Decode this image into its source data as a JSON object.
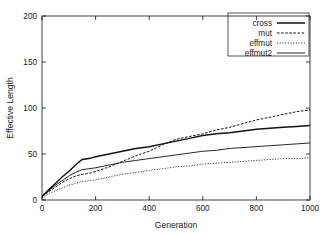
{
  "chart_data": {
    "type": "line",
    "title": "",
    "xlabel": "Generation",
    "ylabel": "Effective Length",
    "xlim": [
      0,
      1000
    ],
    "ylim": [
      0,
      200
    ],
    "xticks": [
      0,
      200,
      400,
      600,
      800,
      1000
    ],
    "yticks": [
      0,
      50,
      100,
      150,
      200
    ],
    "xtick_labels": [
      "0",
      "200",
      "400",
      "600",
      "800",
      "1000"
    ],
    "ytick_labels": [
      "0",
      "50",
      "100",
      "150",
      "200"
    ],
    "grid": false,
    "legend_position": "top-right-inside",
    "x": [
      0,
      25,
      50,
      75,
      100,
      125,
      150,
      175,
      200,
      250,
      300,
      350,
      400,
      450,
      500,
      550,
      600,
      650,
      700,
      750,
      800,
      850,
      900,
      950,
      1000
    ],
    "series": [
      {
        "name": "cross",
        "style": "solid-thick",
        "values": [
          4,
          11,
          18,
          25,
          31,
          38,
          44,
          45,
          47,
          50,
          53,
          56,
          58,
          61,
          64,
          67,
          70,
          72,
          73,
          75,
          77,
          78,
          79,
          80,
          81
        ]
      },
      {
        "name": "mut",
        "style": "dashed",
        "values": [
          4,
          9,
          14,
          19,
          23,
          26,
          28,
          29,
          31,
          36,
          42,
          48,
          53,
          60,
          66,
          69,
          72,
          76,
          79,
          83,
          87,
          90,
          93,
          96,
          98
        ]
      },
      {
        "name": "effmut",
        "style": "fine-dotted",
        "values": [
          3,
          7,
          10,
          13,
          16,
          18,
          20,
          21,
          22,
          25,
          28,
          30,
          32,
          34,
          36,
          37,
          39,
          40,
          41,
          42,
          43,
          44,
          45,
          45,
          46
        ]
      },
      {
        "name": "effmut2",
        "style": "solid-thin",
        "values": [
          4,
          10,
          16,
          21,
          26,
          30,
          33,
          34,
          35,
          38,
          41,
          43,
          45,
          47,
          49,
          51,
          53,
          54,
          56,
          57,
          58,
          59,
          60,
          61,
          62
        ]
      }
    ],
    "legend_entries": [
      "cross",
      "mut",
      "effmut",
      "effmut2"
    ],
    "final_values": {
      "cross": 81,
      "mut": 98,
      "effmut": 46,
      "effmut2": 62
    },
    "colors": {
      "line": "#111111",
      "axis": "#2b2b2b",
      "background": "#ffffff"
    }
  }
}
